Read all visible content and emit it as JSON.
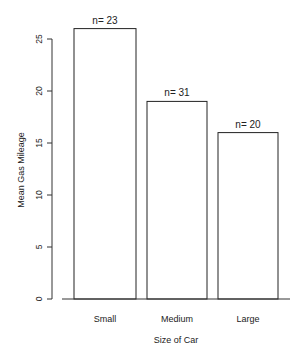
{
  "chart_data": {
    "type": "bar",
    "title": "",
    "xlabel": "Size of Car",
    "ylabel": "Mean Gas Mileage",
    "categories": [
      "Small",
      "Medium",
      "Large"
    ],
    "values": [
      26,
      19,
      16
    ],
    "annotations": [
      "n= 23",
      "n= 31",
      "n= 20"
    ],
    "ylim": [
      0,
      25
    ],
    "yticks": [
      0,
      5,
      10,
      15,
      20,
      25
    ],
    "grid": false,
    "legend": null,
    "bar_fill": "#ffffff",
    "bar_stroke": "#222222"
  }
}
